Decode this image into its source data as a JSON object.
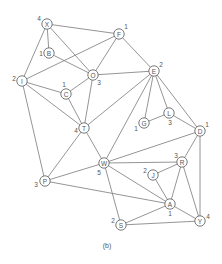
{
  "caption": "(b)",
  "nodes": [
    {
      "id": "X",
      "x": 47,
      "y": 24,
      "weight": "4",
      "wx": 39,
      "wy": 18
    },
    {
      "id": "B",
      "x": 49,
      "y": 53,
      "weight": "1",
      "wx": 41,
      "wy": 53
    },
    {
      "id": "F",
      "x": 119,
      "y": 34,
      "weight": "1",
      "wx": 126,
      "wy": 26
    },
    {
      "id": "I",
      "x": 22,
      "y": 81,
      "weight": "2",
      "wx": 14,
      "wy": 78
    },
    {
      "id": "O",
      "x": 93,
      "y": 75,
      "weight": "3",
      "wx": 99,
      "wy": 82
    },
    {
      "id": "E",
      "x": 154,
      "y": 71,
      "weight": "2",
      "wx": 161,
      "wy": 64
    },
    {
      "id": "C",
      "x": 66,
      "y": 94,
      "weight": "1",
      "wx": 64,
      "wy": 84
    },
    {
      "id": "G",
      "x": 144,
      "y": 123,
      "weight": "1",
      "wx": 136,
      "wy": 128
    },
    {
      "id": "L",
      "x": 169,
      "y": 113,
      "weight": "3",
      "wx": 170,
      "wy": 122
    },
    {
      "id": "D",
      "x": 200,
      "y": 131,
      "weight": "1",
      "wx": 207,
      "wy": 124
    },
    {
      "id": "T",
      "x": 84,
      "y": 128,
      "weight": "4",
      "wx": 76,
      "wy": 130
    },
    {
      "id": "W",
      "x": 104,
      "y": 163,
      "weight": "5",
      "wx": 99,
      "wy": 172
    },
    {
      "id": "R",
      "x": 182,
      "y": 162,
      "weight": "3",
      "wx": 176,
      "wy": 155
    },
    {
      "id": "J",
      "x": 153,
      "y": 175,
      "weight": "2",
      "wx": 145,
      "wy": 170
    },
    {
      "id": "P",
      "x": 45,
      "y": 181,
      "weight": "3",
      "wx": 36,
      "wy": 184
    },
    {
      "id": "A",
      "x": 170,
      "y": 204,
      "weight": "1",
      "wx": 170,
      "wy": 213
    },
    {
      "id": "Y",
      "x": 200,
      "y": 221,
      "weight": "4",
      "wx": 208,
      "wy": 216
    },
    {
      "id": "S",
      "x": 121,
      "y": 225,
      "weight": "2",
      "wx": 113,
      "wy": 220
    }
  ],
  "edges": [
    [
      "X",
      "F"
    ],
    [
      "X",
      "B"
    ],
    [
      "X",
      "I"
    ],
    [
      "X",
      "O"
    ],
    [
      "B",
      "O"
    ],
    [
      "I",
      "F"
    ],
    [
      "I",
      "C"
    ],
    [
      "I",
      "T"
    ],
    [
      "I",
      "P"
    ],
    [
      "F",
      "O"
    ],
    [
      "F",
      "E"
    ],
    [
      "O",
      "E"
    ],
    [
      "O",
      "C"
    ],
    [
      "O",
      "T"
    ],
    [
      "C",
      "T"
    ],
    [
      "E",
      "T"
    ],
    [
      "E",
      "W"
    ],
    [
      "E",
      "G"
    ],
    [
      "E",
      "L"
    ],
    [
      "E",
      "D"
    ],
    [
      "G",
      "L"
    ],
    [
      "L",
      "D"
    ],
    [
      "T",
      "P"
    ],
    [
      "T",
      "W"
    ],
    [
      "P",
      "W"
    ],
    [
      "P",
      "A"
    ],
    [
      "W",
      "D"
    ],
    [
      "W",
      "R"
    ],
    [
      "W",
      "A"
    ],
    [
      "W",
      "S"
    ],
    [
      "D",
      "R"
    ],
    [
      "D",
      "Y"
    ],
    [
      "R",
      "J"
    ],
    [
      "R",
      "A"
    ],
    [
      "R",
      "Y"
    ],
    [
      "J",
      "A"
    ],
    [
      "A",
      "Y"
    ],
    [
      "A",
      "S"
    ],
    [
      "S",
      "Y"
    ]
  ]
}
